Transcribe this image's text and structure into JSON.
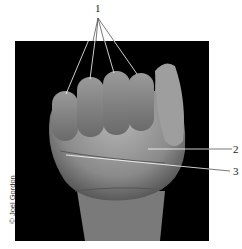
{
  "figure": {
    "background_color": "#000000",
    "skin_tone": "#8a8a8a",
    "callouts": [
      {
        "label": "1",
        "targets": "knuckles / fingertips (4 leader lines)"
      },
      {
        "label": "2",
        "targets": "thenar region"
      },
      {
        "label": "3",
        "targets": "palm crease"
      }
    ],
    "credit": "© Joel Gordon"
  }
}
